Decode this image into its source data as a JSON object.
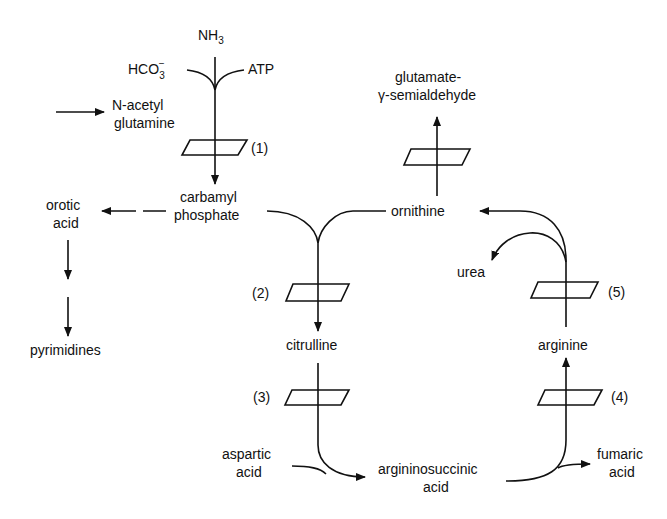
{
  "diagram": {
    "nodes": {
      "nh3": "NH",
      "nh3_sub": "3",
      "hco3": "HCO",
      "hco3_sub": "3",
      "hco3_sup": "−",
      "atp": "ATP",
      "n_acetyl_1": "N-acetyl",
      "n_acetyl_2": "glutamine",
      "carbamyl_1": "carbamyl",
      "carbamyl_2": "phosphate",
      "orotic_1": "orotic",
      "orotic_2": "acid",
      "pyrimidines": "pyrimidines",
      "glutamate_1": "glutamate-",
      "glutamate_2": "γ-semialdehyde",
      "ornithine": "ornithine",
      "urea": "urea",
      "citrulline": "citrulline",
      "arginine": "arginine",
      "aspartic_1": "aspartic",
      "aspartic_2": "acid",
      "argsucc_1": "argininosuccinic",
      "argsucc_2": "acid",
      "fumaric_1": "fumaric",
      "fumaric_2": "acid"
    },
    "enzymes": {
      "e1": "(1)",
      "e2": "(2)",
      "e3": "(3)",
      "e4": "(4)",
      "e5": "(5)"
    }
  }
}
